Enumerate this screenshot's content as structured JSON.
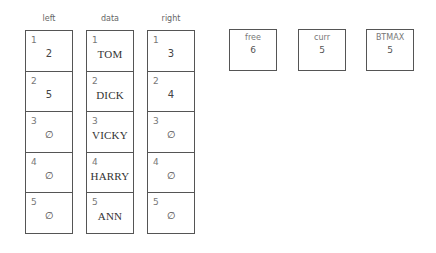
{
  "columns": [
    {
      "label": "left",
      "cells": [
        {
          "index": "1",
          "value": "2"
        },
        {
          "index": "2",
          "value": "5"
        },
        {
          "index": "3",
          "value": "∅"
        },
        {
          "index": "4",
          "value": "∅"
        },
        {
          "index": "5",
          "value": "∅"
        }
      ]
    },
    {
      "label": "data",
      "cells": [
        {
          "index": "1",
          "value": "TOM"
        },
        {
          "index": "2",
          "value": "DICK"
        },
        {
          "index": "3",
          "value": "VICKY"
        },
        {
          "index": "4",
          "value": "HARRY"
        },
        {
          "index": "5",
          "value": "ANN"
        }
      ]
    },
    {
      "label": "right",
      "cells": [
        {
          "index": "1",
          "value": "3"
        },
        {
          "index": "2",
          "value": "4"
        },
        {
          "index": "3",
          "value": "∅"
        },
        {
          "index": "4",
          "value": "∅"
        },
        {
          "index": "5",
          "value": "∅"
        }
      ]
    }
  ],
  "variables": [
    {
      "label": "free",
      "value": "6"
    },
    {
      "label": "curr",
      "value": "5"
    },
    {
      "label": "BTMAX",
      "value": "5"
    }
  ]
}
